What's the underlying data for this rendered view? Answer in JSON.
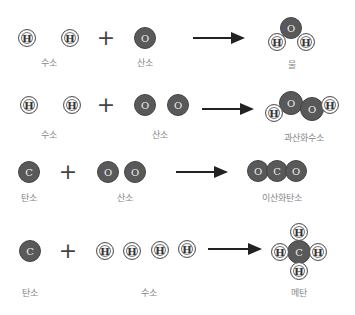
{
  "reactions": [
    {
      "reactants": [
        {
          "atoms": [
            "H",
            "H"
          ],
          "label": "수소"
        },
        {
          "atoms": [
            "O"
          ],
          "label": "산소"
        }
      ],
      "product": {
        "atoms": [
          "O",
          "H",
          "H"
        ],
        "label": "물"
      }
    },
    {
      "reactants": [
        {
          "atoms": [
            "H",
            "H"
          ],
          "label": "수소"
        },
        {
          "atoms": [
            "O",
            "O"
          ],
          "label": "산소"
        }
      ],
      "product": {
        "atoms": [
          "H",
          "O",
          "O",
          "H"
        ],
        "label": "과산화수소"
      }
    },
    {
      "reactants": [
        {
          "atoms": [
            "C"
          ],
          "label": "탄소"
        },
        {
          "atoms": [
            "O",
            "O"
          ],
          "label": "산소"
        }
      ],
      "product": {
        "atoms": [
          "O",
          "C",
          "O"
        ],
        "label": "이산화탄소"
      }
    },
    {
      "reactants": [
        {
          "atoms": [
            "C"
          ],
          "label": "탄소"
        },
        {
          "atoms": [
            "H",
            "H",
            "H",
            "H"
          ],
          "label": "수소"
        }
      ],
      "product": {
        "atoms": [
          "H",
          "H",
          "C",
          "H",
          "H"
        ],
        "label": "메탄"
      }
    }
  ],
  "symbols": {
    "plus": "+"
  },
  "colors": {
    "dark_atom": "#595959",
    "light_atom": "#f4f4f4",
    "label": "#888888",
    "arrow": "#222222"
  }
}
